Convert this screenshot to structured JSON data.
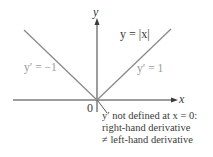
{
  "figure": {
    "function_label": "y = |x|",
    "axes": {
      "x_label": "x",
      "y_label": "y",
      "origin_label": "0"
    },
    "left_branch_label": "y′ = −1",
    "right_branch_label": "y′ = 1",
    "annotation": {
      "line1": "y′ not defined at x = 0:",
      "line2": "right-hand derivative",
      "line3": "≠ left-hand derivative"
    },
    "colors": {
      "axis": "#3a3a3a",
      "graph": "#8a8a8a",
      "deriv_text": "#9a9a9a",
      "text": "#3a3a3a"
    }
  }
}
